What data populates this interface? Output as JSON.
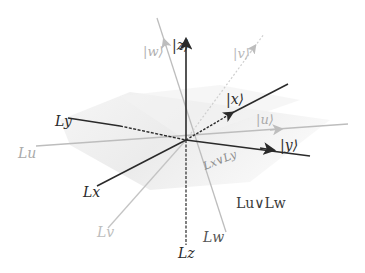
{
  "diagram": {
    "type": "3d-axes-lattice",
    "colors": {
      "dark": "#2a2a2a",
      "light": "#b4b4b4",
      "lighter": "#d0d0d0",
      "plane": "#ececec"
    },
    "kets": {
      "z": "|z⟩",
      "w": "|w⟩",
      "v": "|v⟩",
      "x": "|x⟩",
      "u": "|u⟩",
      "y": "|y⟩"
    },
    "subspaces": {
      "Ly": "Ly",
      "Lu": "Lu",
      "Lx": "Lx",
      "Lv": "Lv",
      "Lz": "Lz",
      "Lw": "Lw",
      "join_xy": "Lx∨Ly",
      "join_uw": "Lu∨Lw"
    }
  }
}
